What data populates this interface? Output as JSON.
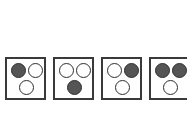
{
  "canvas": {
    "width": 187,
    "height": 115,
    "background_color": "#ffffff"
  },
  "figure": {
    "tile_border_color": "#3a3a3a",
    "dot_outline_color": "#2e2e2e",
    "dot_dark_fill": "#555555",
    "dot_light_fill": "#ffffff",
    "tile_count": 4,
    "dots_per_tile": 3,
    "last_tile_clipped": true
  },
  "tiles": [
    {
      "name": "tile-1",
      "dots": [
        {
          "name": "dot-top-left",
          "position": "top-left",
          "fill": "dark"
        },
        {
          "name": "dot-top-right",
          "position": "top-right",
          "fill": "light"
        },
        {
          "name": "dot-bottom-left",
          "position": "bottom-left",
          "fill": "light"
        }
      ]
    },
    {
      "name": "tile-2",
      "dots": [
        {
          "name": "dot-top-left",
          "position": "top-left",
          "fill": "light"
        },
        {
          "name": "dot-top-right",
          "position": "top-right",
          "fill": "light"
        },
        {
          "name": "dot-bottom-center",
          "position": "bottom-center",
          "fill": "dark"
        }
      ]
    },
    {
      "name": "tile-3",
      "dots": [
        {
          "name": "dot-top-left",
          "position": "top-left",
          "fill": "light"
        },
        {
          "name": "dot-top-right",
          "position": "top-right",
          "fill": "dark"
        },
        {
          "name": "dot-bottom-left",
          "position": "bottom-left",
          "fill": "light"
        }
      ]
    },
    {
      "name": "tile-4",
      "dots": [
        {
          "name": "dot-top-left",
          "position": "top-left",
          "fill": "dark"
        },
        {
          "name": "dot-top-right",
          "position": "top-right",
          "fill": "dark"
        },
        {
          "name": "dot-bottom-left",
          "position": "bottom-left",
          "fill": "light"
        }
      ]
    }
  ]
}
